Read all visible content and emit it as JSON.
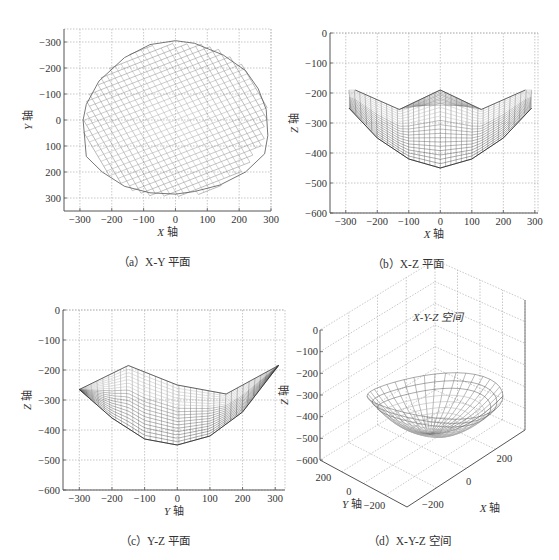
{
  "chart_data": [
    {
      "id": "a",
      "type": "scatter",
      "caption": "(a) X-Y 平面",
      "title": "",
      "xlabel": "X 轴",
      "ylabel": "Y 轴",
      "xlim": [
        -350,
        300
      ],
      "ylim": [
        -350,
        350
      ],
      "xticks": [
        -300,
        -200,
        -100,
        0,
        100,
        200,
        300
      ],
      "yticks": [
        -300,
        -200,
        -100,
        0,
        100,
        200,
        300
      ],
      "grid": true,
      "description": "Top-down projection of a wireframe workspace mesh; roughly circular outline",
      "outline": {
        "x": [
          0,
          60,
          150,
          220,
          260,
          285,
          290,
          280,
          220,
          140,
          60,
          0,
          -80,
          -160,
          -230,
          -280,
          -290,
          -280,
          -240,
          -160,
          -80,
          0
        ],
        "y": [
          305,
          295,
          250,
          190,
          120,
          40,
          -60,
          -130,
          -200,
          -250,
          -275,
          -285,
          -280,
          -255,
          -200,
          -140,
          0,
          60,
          150,
          240,
          290,
          305
        ]
      }
    },
    {
      "id": "b",
      "type": "scatter",
      "caption": "(b) X-Z 平面",
      "title": "",
      "xlabel": "X 轴",
      "ylabel": "Z 轴",
      "xlim": [
        -350,
        310
      ],
      "ylim": [
        -600,
        0
      ],
      "xticks": [
        -300,
        -200,
        -100,
        0,
        100,
        200,
        300
      ],
      "yticks": [
        0,
        -100,
        -200,
        -300,
        -400,
        -500,
        -600
      ],
      "grid": true,
      "description": "Side projection of bowl-shaped wireframe mesh",
      "top_edge": {
        "x": [
          -270,
          -130,
          0,
          130,
          270
        ],
        "z": [
          -190,
          -255,
          -190,
          -255,
          -190
        ]
      },
      "bottom_edge": {
        "x": [
          -290,
          -200,
          -100,
          0,
          100,
          200,
          290
        ],
        "z": [
          -250,
          -350,
          -420,
          -450,
          -420,
          -350,
          -250
        ]
      }
    },
    {
      "id": "c",
      "type": "scatter",
      "caption": "(c) Y-Z 平面",
      "title": "",
      "xlabel": "Y 轴",
      "ylabel": "Z 轴",
      "xlim": [
        -350,
        330
      ],
      "ylim": [
        -600,
        0
      ],
      "xticks": [
        -300,
        -200,
        -100,
        0,
        100,
        200,
        300
      ],
      "yticks": [
        0,
        -100,
        -200,
        -300,
        -400,
        -500,
        -600
      ],
      "grid": true,
      "description": "Side projection of bowl-shaped mesh viewed along X",
      "top_edge": {
        "y": [
          -300,
          -150,
          0,
          150,
          310
        ],
        "z": [
          -265,
          -185,
          -250,
          -280,
          -185
        ]
      },
      "bottom_edge": {
        "y": [
          -300,
          -200,
          -100,
          0,
          100,
          200,
          310
        ],
        "z": [
          -265,
          -360,
          -430,
          -450,
          -420,
          -340,
          -185
        ]
      }
    },
    {
      "id": "d",
      "type": "scatter",
      "caption": "(d) X-Y-Z 空间",
      "title": "X-Y-Z 空间",
      "xlabel": "X 轴",
      "ylabel": "Y 轴",
      "zlabel": "Z 轴",
      "xticks": [
        -200,
        0,
        200
      ],
      "yticks": [
        200,
        0,
        -200
      ],
      "zticks": [
        0,
        -100,
        -200,
        -300,
        -400,
        -500,
        -600
      ],
      "zlim": [
        -600,
        0
      ],
      "grid": true,
      "description": "3D perspective view of bowl-shaped workspace mesh"
    }
  ],
  "panels": {
    "a": {
      "caption": "（a）X-Y 平面",
      "xlabel_italic": "X",
      "xlabel_cn": "轴",
      "ylabel_italic": "Y",
      "ylabel_cn": "轴",
      "xticks": [
        "−300",
        "−200",
        "−100",
        "0",
        "100",
        "200",
        "300"
      ],
      "yticks": [
        "300",
        "200",
        "100",
        "0",
        "−100",
        "−200",
        "−300"
      ]
    },
    "b": {
      "caption": "（b）X-Z 平面",
      "xlabel_italic": "X",
      "xlabel_cn": "轴",
      "ylabel_italic": "Z",
      "ylabel_cn": "轴",
      "xticks": [
        "−300",
        "−200",
        "−100",
        "0",
        "100",
        "200",
        "300"
      ],
      "yticks": [
        "0",
        "−100",
        "−200",
        "−300",
        "−400",
        "−500",
        "−600"
      ]
    },
    "c": {
      "caption": "（c）Y-Z 平面",
      "xlabel_italic": "Y",
      "xlabel_cn": "轴",
      "ylabel_italic": "Z",
      "ylabel_cn": "轴",
      "xticks": [
        "−300",
        "−200",
        "−100",
        "0",
        "100",
        "200",
        "300"
      ],
      "yticks": [
        "0",
        "−100",
        "−200",
        "−300",
        "−400",
        "−500",
        "−600"
      ]
    },
    "d": {
      "title": "X-Y-Z 空间",
      "caption": "（d）X-Y-Z 空间",
      "xlabel_italic": "X",
      "xlabel_cn": "轴",
      "ylabel_italic": "Y",
      "ylabel_cn": "轴",
      "zlabel_italic": "Z",
      "zlabel_cn": "轴",
      "zticks": [
        "0",
        "−100",
        "−200",
        "−300",
        "−400",
        "−500",
        "−600"
      ],
      "xticks": [
        "−200",
        "0",
        "200"
      ],
      "yticks": [
        "200",
        "0",
        "−200"
      ]
    }
  },
  "colors": {
    "grid": "#b0b0b0",
    "axis": "#555555",
    "mesh_dark": "#3a3a3a",
    "mesh_light": "#c8c8c8"
  }
}
